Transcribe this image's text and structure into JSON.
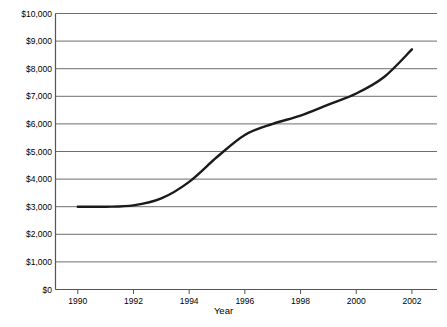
{
  "chart_data": {
    "type": "line",
    "title": "",
    "xlabel": "Year",
    "ylabel": "",
    "xlim": [
      1989.2,
      2002.9
    ],
    "ylim": [
      0,
      10000
    ],
    "grid": "horizontal",
    "legend": "none",
    "line_color": "#1a1a1a",
    "x": [
      1990,
      1991,
      1992,
      1993,
      1994,
      1995,
      1996,
      1997,
      1998,
      1999,
      2000,
      2001,
      2002
    ],
    "values": [
      3000,
      3000,
      3050,
      3300,
      3900,
      4800,
      5600,
      6000,
      6300,
      6700,
      7100,
      7700,
      8700
    ],
    "series": [
      {
        "name": "value",
        "values": [
          3000,
          3000,
          3050,
          3300,
          3900,
          4800,
          5600,
          6000,
          6300,
          6700,
          7100,
          7700,
          8700
        ]
      }
    ],
    "yticks": [
      0,
      1000,
      2000,
      3000,
      4000,
      5000,
      6000,
      7000,
      8000,
      9000,
      10000
    ],
    "ytick_labels": [
      "$0",
      "$1,000",
      "$2,000",
      "$3,000",
      "$4,000",
      "$5,000",
      "$6,000",
      "$7,000",
      "$8,000",
      "$9,000",
      "$10,000"
    ],
    "xticks": [
      1990,
      1992,
      1994,
      1996,
      1998,
      2000,
      2002
    ],
    "xtick_labels": [
      "1990",
      "1992",
      "1994",
      "1996",
      "1998",
      "2000",
      "2002"
    ]
  },
  "axis": {
    "x_title": "Year"
  }
}
